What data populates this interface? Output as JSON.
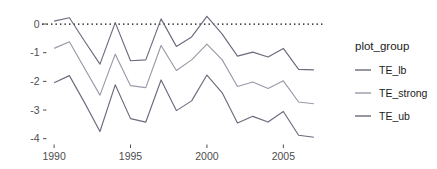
{
  "chart_data": {
    "type": "line",
    "title": "",
    "subtitle": "",
    "xlabel": "",
    "ylabel": "",
    "x": [
      1990,
      1991,
      1992,
      1993,
      1994,
      1995,
      1996,
      1997,
      1998,
      1999,
      2000,
      2001,
      2002,
      2003,
      2004,
      2005,
      2006,
      2007
    ],
    "xlim": [
      1989.6,
      2007.4
    ],
    "ylim": [
      -4.15,
      0.35
    ],
    "xticks": [
      1990,
      1995,
      2000,
      2005
    ],
    "xtick_labels": [
      "1990",
      "1995",
      "2000",
      "2005"
    ],
    "yticks": [
      0,
      -1,
      -2,
      -3,
      -4
    ],
    "ytick_labels": [
      "0",
      "-1",
      "-2",
      "-3",
      "-4"
    ],
    "grid": false,
    "legend_position": "right",
    "legend_title": "plot_group",
    "annotations": [
      {
        "type": "hline",
        "y": 0,
        "style": "dotted",
        "color": "#000000"
      }
    ],
    "series": [
      {
        "name": "TE_ub",
        "color": "#6b6b7d",
        "values": [
          0.1,
          0.22,
          -0.6,
          -1.4,
          0.05,
          -1.28,
          -1.25,
          0.18,
          -0.78,
          -0.45,
          0.27,
          -0.35,
          -1.12,
          -0.98,
          -1.15,
          -0.85,
          -1.58,
          -1.6
        ]
      },
      {
        "name": "TE_strong",
        "color": "#9a9aa8",
        "values": [
          -0.85,
          -0.62,
          -1.55,
          -2.48,
          -1.05,
          -2.15,
          -2.22,
          -0.75,
          -1.62,
          -1.25,
          -0.7,
          -1.25,
          -2.18,
          -2.02,
          -2.25,
          -1.98,
          -2.72,
          -2.78
        ]
      },
      {
        "name": "TE_lb",
        "color": "#6b6b7d",
        "values": [
          -2.05,
          -1.8,
          -2.75,
          -3.75,
          -2.12,
          -3.3,
          -3.42,
          -1.95,
          -3.02,
          -2.68,
          -1.78,
          -2.4,
          -3.45,
          -3.22,
          -3.42,
          -3.05,
          -3.88,
          -3.95
        ]
      }
    ]
  },
  "legend": {
    "title": "plot_group",
    "items": [
      {
        "label": "TE_lb",
        "color": "#6b6b7d"
      },
      {
        "label": "TE_strong",
        "color": "#9a9aa8"
      },
      {
        "label": "TE_ub",
        "color": "#6b6b7d"
      }
    ]
  },
  "axes": {
    "y_labels": [
      "0",
      "-1",
      "-2",
      "-3",
      "-4"
    ],
    "x_labels": [
      "1990",
      "1995",
      "2000",
      "2005"
    ]
  }
}
